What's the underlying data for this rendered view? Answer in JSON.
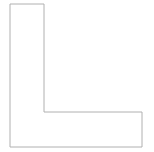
{
  "canvas": {
    "width": 154,
    "height": 152,
    "background_color": "#ffffff",
    "title": "",
    "caption": ""
  },
  "figure": {
    "name": "l-shaped-polygon",
    "label": "",
    "stroke_color": "#b0b0b0",
    "fill_color": "#ffffff",
    "stroke_width": 1,
    "closed": true,
    "vertex_count": 6,
    "points": "10,4 44,4 44,112 142,112 142,147 10,147",
    "vertices": [
      {
        "name": "top-left",
        "x": 10,
        "y": 4
      },
      {
        "name": "top-right",
        "x": 44,
        "y": 4
      },
      {
        "name": "inner-right",
        "x": 44,
        "y": 112
      },
      {
        "name": "mid-right",
        "x": 142,
        "y": 112
      },
      {
        "name": "bottom-right",
        "x": 142,
        "y": 147
      },
      {
        "name": "bottom-left",
        "x": 10,
        "y": 147
      }
    ]
  }
}
